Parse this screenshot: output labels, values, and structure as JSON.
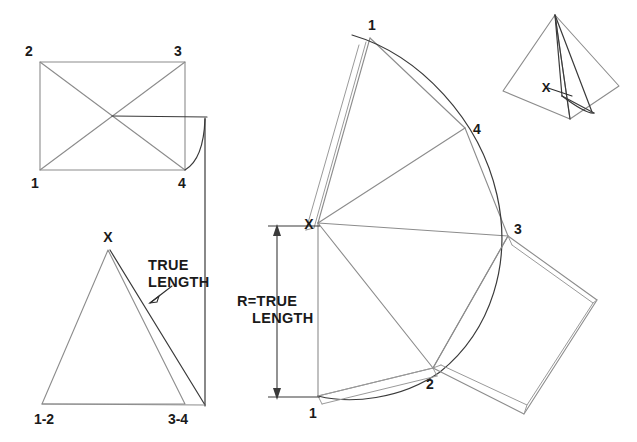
{
  "drawing": {
    "title": "Radial line development of a pyramid",
    "background_color": "#ffffff",
    "line_color": "#8c8c8c",
    "dark_line_color": "#3a3a3a",
    "text_color": "#1a1a1a"
  },
  "top_view": {
    "name": "top-view-rectangle",
    "corner_labels": {
      "top_left": "2",
      "top_right": "3",
      "bottom_left": "1",
      "bottom_right": "4"
    }
  },
  "elevation": {
    "name": "front-elevation-triangle",
    "apex_label": "X",
    "base_left_label": "1-2",
    "base_right_label": "3-4",
    "annotation_line1": "TRUE",
    "annotation_line2": "LENGTH"
  },
  "development": {
    "name": "pattern-development",
    "apex_label": "X",
    "radial_labels": {
      "top": "1",
      "upper_right": "4",
      "right": "3",
      "lower": "2",
      "bottom": "1"
    },
    "dimension_line1": "R=TRUE",
    "dimension_line2": "LENGTH"
  },
  "pictorial": {
    "name": "pyramid-pictorial",
    "apex_label": "X"
  }
}
